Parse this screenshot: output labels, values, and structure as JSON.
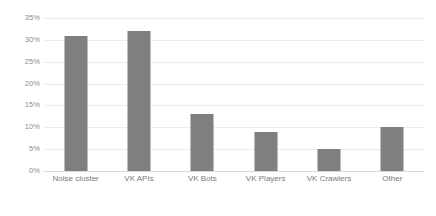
{
  "chart_data": {
    "type": "bar",
    "title": "",
    "subtitle": "",
    "xlabel": "",
    "ylabel": "",
    "categories": [
      "Noise cluster",
      "VK APIs",
      "VK Bots",
      "VK Players",
      "VK Crawlers",
      "Other"
    ],
    "values": [
      31,
      32,
      13,
      9,
      5,
      10
    ],
    "value_labels": [
      "31%",
      "32%",
      "13%",
      "9%",
      "5%",
      "10%"
    ],
    "ylim": [
      0,
      35
    ],
    "ytick_values": [
      0,
      5,
      10,
      15,
      20,
      25,
      30,
      35
    ],
    "ytick_labels": [
      "0%",
      "5%",
      "10%",
      "15%",
      "20%",
      "25%",
      "30%",
      "35%"
    ],
    "grid": true,
    "legend": false,
    "legend_position": "none",
    "bar_color": "#7f7f7f",
    "gridline_color": "#ebeced",
    "axis_color": "#d9dadb",
    "tick_label_color": "#8c8c8c",
    "category_label_color": "#7a7a7a",
    "background_color": "#ffffff"
  }
}
